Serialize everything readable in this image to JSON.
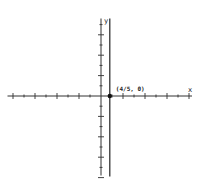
{
  "chart_data": {
    "type": "line",
    "title": "",
    "xlabel": "x",
    "ylabel": "y",
    "xlim": [
      -8.5,
      8
    ],
    "ylim": [
      -7.5,
      7.5
    ],
    "x_ticks": [
      -8,
      -7,
      -6,
      -5,
      -4,
      -3,
      -2,
      -1,
      1,
      2,
      3,
      4,
      5,
      6,
      7,
      8
    ],
    "y_ticks": [
      -8,
      -7,
      -6,
      -5,
      -4,
      -3,
      -2,
      -1,
      1,
      2,
      3,
      4,
      5,
      6,
      7
    ],
    "major_every": 2,
    "grid": false,
    "series": [
      {
        "name": "vertical line x = 4/5",
        "kind": "vertical-line",
        "x": 0.8,
        "color": "#222222"
      }
    ],
    "points": [
      {
        "x": 0.8,
        "y": 0,
        "label": "(4/5, 0)"
      }
    ]
  }
}
